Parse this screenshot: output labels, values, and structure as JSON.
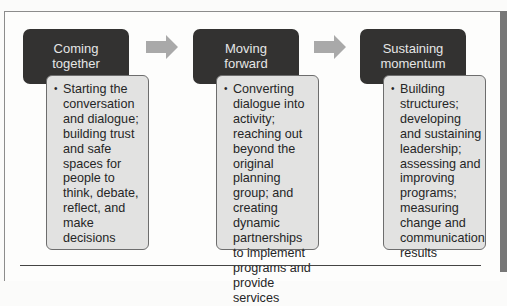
{
  "diagram": {
    "type": "process-flow",
    "stages": [
      {
        "title_lines": [
          "Coming",
          "together"
        ],
        "description": "Starting the conversation and dialogue; building trust and safe spaces for people to think, debate, reflect, and make decisions"
      },
      {
        "title_lines": [
          "Moving",
          "forward"
        ],
        "description": "Converting dialogue into activity; reaching out beyond the original planning group; and creating dynamic partnerships to implement programs and provide services"
      },
      {
        "title_lines": [
          "Sustaining",
          "momentum"
        ],
        "description": "Building structures; developing and sustaining leadership; assessing and improving programs; measuring change and communication results"
      }
    ],
    "connectors": [
      "arrow-right-icon",
      "arrow-right-icon"
    ],
    "colors": {
      "header_bg": "#333231",
      "header_text": "#e6e6e6",
      "body_bg": "#e2e2e1",
      "arrow": "#a9a9a9"
    }
  }
}
